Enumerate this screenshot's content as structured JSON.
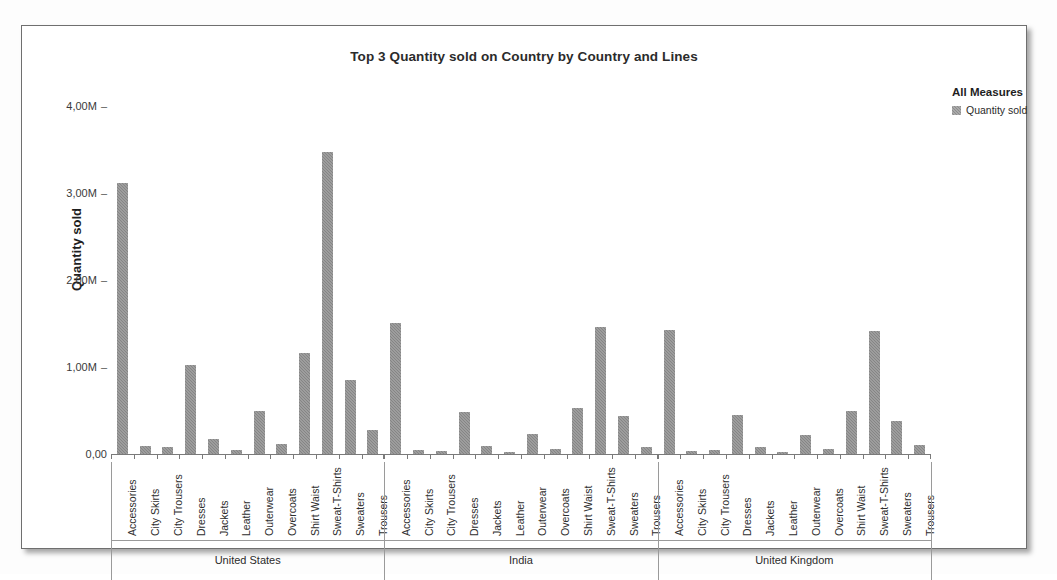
{
  "chart_title": "Top 3 Quantity sold on Country by Country and Lines",
  "legend": {
    "title": "All Measures",
    "items": [
      {
        "label": "Quantity sold",
        "color": "#8c8c8c",
        "swatch_name": "legend-swatch-quantity-sold"
      }
    ]
  },
  "axes": {
    "y_title": "Quantity sold",
    "y_ticks": [
      "0,00",
      "1,00M",
      "2,00M",
      "3,00M",
      "4,00M"
    ],
    "y_tick_values": [
      0,
      1000000,
      2000000,
      3000000,
      4000000
    ],
    "y_min": 0,
    "y_max": 4000000,
    "x_title": ""
  },
  "chart_data": {
    "type": "bar",
    "title": "Top 3 Quantity sold on Country by Country and Lines",
    "xlabel": "",
    "ylabel": "Quantity sold",
    "ylim": [
      0,
      4000000
    ],
    "grid": false,
    "legend_position": "right",
    "categories": [
      "Accessories",
      "City Skirts",
      "City Trousers",
      "Dresses",
      "Jackets",
      "Leather",
      "Outerwear",
      "Overcoats",
      "Shirt Waist",
      "Sweat-T-Shirts",
      "Sweaters",
      "Trousers"
    ],
    "groups": [
      {
        "name": "United States",
        "series_name": "Quantity sold",
        "values": [
          3120000,
          90000,
          85000,
          1020000,
          175000,
          45000,
          500000,
          110000,
          1160000,
          3470000,
          850000,
          280000
        ]
      },
      {
        "name": "India",
        "series_name": "Quantity sold",
        "values": [
          1510000,
          45000,
          35000,
          480000,
          90000,
          20000,
          230000,
          55000,
          530000,
          1460000,
          440000,
          85000
        ]
      },
      {
        "name": "United Kingdom",
        "series_name": "Quantity sold",
        "values": [
          1430000,
          30000,
          50000,
          450000,
          75000,
          25000,
          215000,
          60000,
          490000,
          1410000,
          385000,
          100000
        ]
      }
    ]
  }
}
